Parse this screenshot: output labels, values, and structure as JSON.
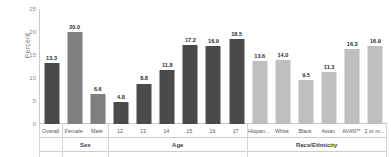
{
  "chart_data": {
    "type": "bar",
    "title": "",
    "xlabel": "",
    "ylabel": "Percent",
    "ylim": [
      0,
      25
    ],
    "yticks": [
      "0",
      "5",
      "10",
      "15",
      "20",
      "25"
    ],
    "grid": false,
    "legend": "none",
    "categories": [
      "Overall",
      "Female",
      "Male",
      "12",
      "13",
      "14",
      "15",
      "16",
      "17",
      "Hispan...",
      "White",
      "Black",
      "Asian",
      "AI/AN**",
      "2 or m..."
    ],
    "values": [
      13.3,
      20.0,
      6.6,
      4.8,
      8.8,
      11.8,
      17.2,
      16.9,
      18.5,
      13.6,
      14.0,
      9.5,
      11.3,
      16.3,
      16.9
    ],
    "value_labels": [
      "13.3",
      "20.0",
      "6.6",
      "4.8",
      "8.8",
      "11.8",
      "17.2",
      "16.9",
      "18.5",
      "13.6",
      "14.0",
      "9.5",
      "11.3",
      "16.3",
      "16.9"
    ],
    "bar_colors": [
      "#4a4a4a",
      "#7f7f7f",
      "#7f7f7f",
      "#4a4a4a",
      "#4a4a4a",
      "#4a4a4a",
      "#4a4a4a",
      "#4a4a4a",
      "#4a4a4a",
      "#bfbfbf",
      "#bfbfbf",
      "#bfbfbf",
      "#bfbfbf",
      "#bfbfbf",
      "#bfbfbf"
    ],
    "groups": [
      {
        "label": "",
        "start": 0,
        "count": 1
      },
      {
        "label": "Sex",
        "start": 1,
        "count": 2
      },
      {
        "label": "Age",
        "start": 3,
        "count": 6
      },
      {
        "label": "Race/Ethnicity",
        "start": 9,
        "count": 6
      }
    ]
  }
}
